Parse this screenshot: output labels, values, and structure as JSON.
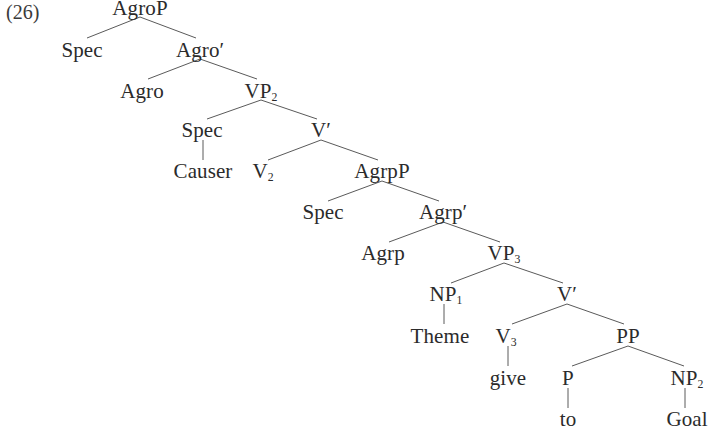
{
  "figure": {
    "example_number": "(26)",
    "type": "syntax-tree",
    "background_color": "#ffffff",
    "text_color": "#2b2b2b",
    "line_color": "#5a5a5a"
  },
  "nodes": [
    {
      "id": "agroP",
      "label": "AgroP",
      "sub": "",
      "x": 140,
      "y": 8,
      "clipped_top": true
    },
    {
      "id": "spec1",
      "label": "Spec",
      "sub": "",
      "x": 82,
      "y": 50
    },
    {
      "id": "agroBar",
      "label": "Agro",
      "sub": "",
      "prime": true,
      "x": 200,
      "y": 50
    },
    {
      "id": "agro",
      "label": "Agro",
      "sub": "",
      "x": 142,
      "y": 91
    },
    {
      "id": "vp2",
      "label": "VP",
      "sub": "2",
      "x": 261,
      "y": 91
    },
    {
      "id": "spec2",
      "label": "Spec",
      "sub": "",
      "x": 202,
      "y": 130
    },
    {
      "id": "vBar1",
      "label": "V",
      "sub": "",
      "prime": true,
      "x": 321,
      "y": 130
    },
    {
      "id": "causer",
      "label": "Causer",
      "sub": "",
      "x": 203,
      "y": 171
    },
    {
      "id": "v2",
      "label": "V",
      "sub": "2",
      "x": 263,
      "y": 171
    },
    {
      "id": "agrpP",
      "label": "AgrpP",
      "sub": "",
      "x": 382,
      "y": 171
    },
    {
      "id": "spec3",
      "label": "Spec",
      "sub": "",
      "x": 323,
      "y": 212
    },
    {
      "id": "agrpBar",
      "label": "Agrp",
      "sub": "",
      "prime": true,
      "x": 443,
      "y": 212
    },
    {
      "id": "agrp",
      "label": "Agrp",
      "sub": "",
      "x": 383,
      "y": 253
    },
    {
      "id": "vp3",
      "label": "VP",
      "sub": "3",
      "x": 504,
      "y": 253
    },
    {
      "id": "np1",
      "label": "NP",
      "sub": "1",
      "x": 446,
      "y": 294
    },
    {
      "id": "vBar2",
      "label": "V",
      "sub": "",
      "prime": true,
      "x": 567,
      "y": 294
    },
    {
      "id": "theme",
      "label": "Theme",
      "sub": "",
      "x": 440,
      "y": 336
    },
    {
      "id": "v3",
      "label": "V",
      "sub": "3",
      "x": 506,
      "y": 336
    },
    {
      "id": "pp",
      "label": "PP",
      "sub": "",
      "x": 628,
      "y": 336
    },
    {
      "id": "give",
      "label": "give",
      "sub": "",
      "x": 508,
      "y": 378
    },
    {
      "id": "p",
      "label": "P",
      "sub": "",
      "x": 568,
      "y": 378
    },
    {
      "id": "np2",
      "label": "NP",
      "sub": "2",
      "x": 687,
      "y": 378
    },
    {
      "id": "to",
      "label": "to",
      "sub": "",
      "x": 568,
      "y": 419
    },
    {
      "id": "goal",
      "label": "Goal",
      "sub": "",
      "x": 687,
      "y": 419
    }
  ],
  "edges": [
    {
      "from": "agroP",
      "to": "spec1",
      "x1": 140,
      "y1": 17,
      "x2": 87,
      "y2": 38
    },
    {
      "from": "agroP",
      "to": "agroBar",
      "x1": 140,
      "y1": 17,
      "x2": 196,
      "y2": 38
    },
    {
      "from": "agroBar",
      "to": "agro",
      "x1": 200,
      "y1": 59,
      "x2": 148,
      "y2": 79
    },
    {
      "from": "agroBar",
      "to": "vp2",
      "x1": 200,
      "y1": 59,
      "x2": 257,
      "y2": 79
    },
    {
      "from": "vp2",
      "to": "spec2",
      "x1": 261,
      "y1": 100,
      "x2": 207,
      "y2": 119
    },
    {
      "from": "vp2",
      "to": "vBar1",
      "x1": 261,
      "y1": 100,
      "x2": 317,
      "y2": 119
    },
    {
      "from": "spec2",
      "to": "causer",
      "x1": 203,
      "y1": 140,
      "x2": 203,
      "y2": 160
    },
    {
      "from": "vBar1",
      "to": "v2",
      "x1": 321,
      "y1": 140,
      "x2": 268,
      "y2": 160
    },
    {
      "from": "vBar1",
      "to": "agrpP",
      "x1": 321,
      "y1": 140,
      "x2": 378,
      "y2": 160
    },
    {
      "from": "agrpP",
      "to": "spec3",
      "x1": 382,
      "y1": 181,
      "x2": 328,
      "y2": 201
    },
    {
      "from": "agrpP",
      "to": "agrpBar",
      "x1": 382,
      "y1": 181,
      "x2": 439,
      "y2": 201
    },
    {
      "from": "agrpBar",
      "to": "agrp",
      "x1": 443,
      "y1": 222,
      "x2": 389,
      "y2": 242
    },
    {
      "from": "agrpBar",
      "to": "vp3",
      "x1": 443,
      "y1": 222,
      "x2": 500,
      "y2": 242
    },
    {
      "from": "vp3",
      "to": "np1",
      "x1": 504,
      "y1": 263,
      "x2": 451,
      "y2": 283
    },
    {
      "from": "vp3",
      "to": "vBar2",
      "x1": 504,
      "y1": 263,
      "x2": 563,
      "y2": 283
    },
    {
      "from": "np1",
      "to": "theme",
      "x1": 444,
      "y1": 304,
      "x2": 444,
      "y2": 324
    },
    {
      "from": "vBar2",
      "to": "v3",
      "x1": 567,
      "y1": 304,
      "x2": 512,
      "y2": 324
    },
    {
      "from": "vBar2",
      "to": "pp",
      "x1": 567,
      "y1": 304,
      "x2": 624,
      "y2": 324
    },
    {
      "from": "v3",
      "to": "give",
      "x1": 508,
      "y1": 346,
      "x2": 508,
      "y2": 366
    },
    {
      "from": "pp",
      "to": "p",
      "x1": 628,
      "y1": 346,
      "x2": 572,
      "y2": 366
    },
    {
      "from": "pp",
      "to": "np2",
      "x1": 628,
      "y1": 346,
      "x2": 684,
      "y2": 366
    },
    {
      "from": "p",
      "to": "to",
      "x1": 568,
      "y1": 388,
      "x2": 568,
      "y2": 408
    },
    {
      "from": "np2",
      "to": "goal",
      "x1": 685,
      "y1": 388,
      "x2": 685,
      "y2": 408
    }
  ],
  "example_label": {
    "text": "(26)",
    "x": 6,
    "y": 2
  }
}
